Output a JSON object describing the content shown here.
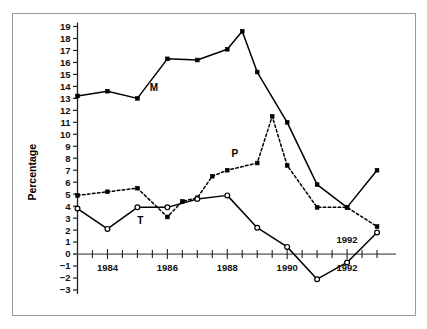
{
  "chart_data": {
    "type": "line",
    "title": "",
    "xlabel": "",
    "ylabel": "Percentage",
    "ylim": [
      -3,
      19
    ],
    "xlim": [
      1983.0,
      1993.5
    ],
    "grid": false,
    "legend": "inline-labels",
    "y_ticks": [
      -3,
      -2,
      -1,
      0,
      1,
      2,
      3,
      4,
      5,
      6,
      7,
      8,
      9,
      10,
      11,
      12,
      13,
      14,
      15,
      16,
      17,
      18,
      19
    ],
    "y_tick_labels": [
      "−3",
      "−2",
      "−1",
      "0",
      "1",
      "2",
      "3",
      "4",
      "5",
      "6",
      "7",
      "8",
      "9",
      "10",
      "11",
      "12",
      "13",
      "14",
      "15",
      "16",
      "17",
      "18",
      "19"
    ],
    "x_ticks": [
      1983.5,
      1984.0,
      1984.5,
      1985.0,
      1985.5,
      1986.0,
      1986.5,
      1987.0,
      1987.5,
      1988.0,
      1988.5,
      1989.0,
      1989.5,
      1990.0,
      1990.5,
      1991.0,
      1991.5,
      1992.0,
      1992.5,
      1993.0
    ],
    "x_tick_labels": [
      "1984",
      "1986",
      "1988",
      "1990",
      "1992"
    ],
    "x_labeled_ticks": [
      1984.0,
      1986.0,
      1988.0,
      1990.0,
      1992.0
    ],
    "annotations": [
      {
        "text": "1992",
        "x": 1992.0,
        "y": 0.9,
        "name": "x-axis-annotation-1992"
      }
    ],
    "series": [
      {
        "name": "M",
        "label": "M",
        "label_x": 1985.55,
        "label_y": 13.6,
        "linestyle": "solid",
        "marker": "filled-square",
        "color": "#000000",
        "x": [
          1983.0,
          1984.0,
          1985.0,
          1986.0,
          1987.0,
          1988.0,
          1988.5,
          1989.0,
          1990.0,
          1991.0,
          1992.0,
          1993.0
        ],
        "values": [
          13.2,
          13.6,
          13.0,
          16.3,
          16.2,
          17.1,
          18.6,
          15.2,
          11.0,
          5.8,
          3.9,
          7.0
        ]
      },
      {
        "name": "P",
        "label": "P",
        "label_x": 1988.25,
        "label_y": 8.1,
        "linestyle": "dashed",
        "marker": "filled-square",
        "color": "#000000",
        "x": [
          1983.0,
          1984.0,
          1985.0,
          1986.0,
          1986.5,
          1987.0,
          1987.5,
          1988.0,
          1989.0,
          1989.5,
          1990.0,
          1991.0,
          1992.0,
          1993.0
        ],
        "values": [
          4.9,
          5.2,
          5.5,
          3.1,
          4.4,
          4.7,
          6.5,
          7.0,
          7.6,
          11.5,
          7.4,
          3.9,
          3.9,
          2.3
        ]
      },
      {
        "name": "T",
        "label": "T",
        "label_x": 1985.1,
        "label_y": 2.5,
        "linestyle": "solid",
        "marker": "open-circle",
        "color": "#000000",
        "x": [
          1983.0,
          1984.0,
          1985.0,
          1986.0,
          1987.0,
          1988.0,
          1989.0,
          1990.0,
          1991.0,
          1992.0,
          1993.0
        ],
        "values": [
          3.8,
          2.1,
          3.9,
          3.9,
          4.6,
          4.9,
          2.2,
          0.6,
          -2.1,
          -0.7,
          1.8
        ]
      }
    ]
  },
  "axis": {
    "y_title": "Percentage"
  }
}
